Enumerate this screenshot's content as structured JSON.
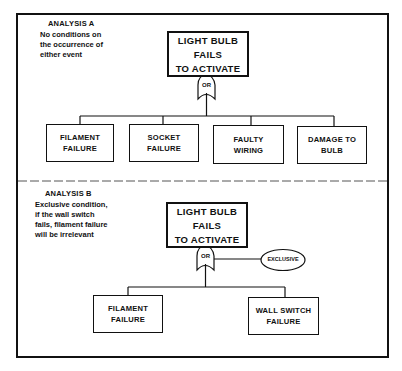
{
  "diagram": {
    "type": "fault-tree",
    "colors": {
      "line": "#111111",
      "background": "#ffffff"
    },
    "analysis_a": {
      "title": "ANALYSIS A",
      "description_lines": [
        "No conditions on",
        "the occurrence of",
        "either event"
      ],
      "top_event": {
        "lines": [
          "LIGHT BULB",
          "FAILS",
          "TO ACTIVATE"
        ]
      },
      "gate": {
        "label": "OR",
        "type": "or-gate"
      },
      "basic_events": [
        {
          "lines": [
            "FILAMENT",
            "FAILURE"
          ]
        },
        {
          "lines": [
            "SOCKET",
            "FAILURE"
          ]
        },
        {
          "lines": [
            "FAULTY",
            "WIRING"
          ]
        },
        {
          "lines": [
            "DAMAGE TO",
            "BULB"
          ]
        }
      ]
    },
    "analysis_b": {
      "title": "ANALYSIS B",
      "description_lines": [
        "Exclusive condition,",
        "if the wall switch",
        "fails, filament failure",
        "will be irrelevant"
      ],
      "top_event": {
        "lines": [
          "LIGHT BULB",
          "FAILS",
          "TO ACTIVATE"
        ]
      },
      "gate": {
        "label": "OR",
        "type": "or-gate"
      },
      "condition": {
        "label": "EXCLUSIVE"
      },
      "basic_events": [
        {
          "lines": [
            "FILAMENT",
            "FAILURE"
          ]
        },
        {
          "lines": [
            "WALL SWITCH",
            "FAILURE"
          ]
        }
      ]
    }
  }
}
